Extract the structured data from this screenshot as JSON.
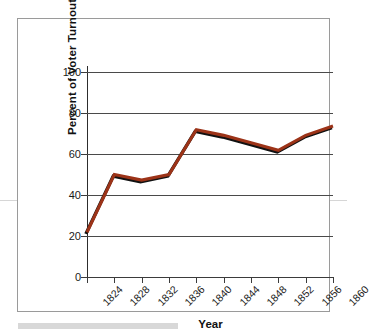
{
  "chart_data": {
    "type": "line",
    "title": "",
    "xlabel": "Year",
    "ylabel": "Percent of Voter Turnout",
    "x": [
      1824,
      1828,
      1832,
      1836,
      1840,
      1844,
      1848,
      1852,
      1856,
      1860
    ],
    "xticklabels": [
      "1824",
      "1828",
      "1832",
      "1836",
      "1840",
      "1844",
      "1848",
      "1852",
      "1856",
      "1860"
    ],
    "yticklabels": [
      "0",
      "20",
      "40",
      "60",
      "80",
      "100"
    ],
    "yticks": [
      0,
      20,
      40,
      60,
      80,
      100
    ],
    "ylim": [
      0,
      110
    ],
    "xlim": [
      1824,
      1860
    ],
    "grid": "horizontal",
    "legend": "none",
    "series": [
      {
        "name": "Percent of Voter Turnout",
        "color": "#9c3318",
        "values": [
          24,
          55,
          52,
          55,
          79,
          76,
          72,
          68,
          76,
          81
        ]
      }
    ]
  },
  "axes": {
    "y_title": "Percent of Voter Turnout",
    "x_title": "Year",
    "y_labels": [
      "100",
      "80",
      "60",
      "40",
      "20",
      "0"
    ],
    "x_labels": [
      "1824",
      "1828",
      "1832",
      "1836",
      "1840",
      "1844",
      "1848",
      "1852",
      "1856",
      "1860"
    ]
  },
  "colors": {
    "line": "#9c3318",
    "line_shadow": "#111111",
    "gridline": "#4a4a4a",
    "axis": "#2d2d2d",
    "frame": "#9a9a9a",
    "text": "#1a1a1a"
  }
}
